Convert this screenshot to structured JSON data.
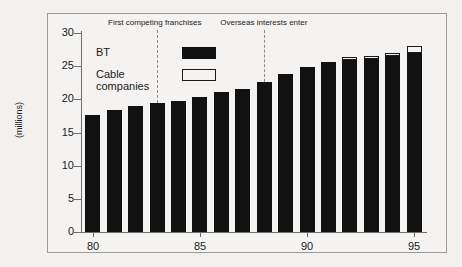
{
  "chart_data": {
    "type": "bar",
    "title": "",
    "subtitle": "",
    "xlabel": "",
    "ylabel": "(millions)",
    "ylim": [
      0,
      30
    ],
    "yticks": [
      0,
      5,
      10,
      15,
      20,
      25,
      30
    ],
    "ytick_labels": [
      "0",
      "5",
      "10",
      "15",
      "20",
      "25",
      "30"
    ],
    "xticks": [
      80,
      85,
      90,
      95
    ],
    "xtick_labels": [
      "80",
      "85",
      "90",
      "95"
    ],
    "categories": [
      "80",
      "81",
      "82",
      "83",
      "84",
      "85",
      "86",
      "87",
      "88",
      "89",
      "90",
      "91",
      "92",
      "93",
      "94",
      "95"
    ],
    "grid": false,
    "legend_position": "inside-top-left",
    "stacked": true,
    "series": [
      {
        "name": "BT",
        "color": "#111111",
        "values": [
          17.6,
          18.4,
          19.0,
          19.4,
          19.7,
          20.4,
          21.1,
          21.6,
          22.6,
          23.8,
          24.9,
          25.6,
          25.9,
          26.1,
          26.6,
          27.0
        ]
      },
      {
        "name": "Cable companies",
        "color": "#ffffff",
        "values": [
          0,
          0,
          0,
          0,
          0,
          0,
          0,
          0,
          0,
          0,
          0,
          0,
          0.2,
          0.3,
          0.4,
          1.1
        ]
      }
    ],
    "annotations": [
      {
        "label": "First competing franchises",
        "x_category": "83",
        "line_style": "dashed"
      },
      {
        "label": "Overseas interests enter",
        "x_category": "88",
        "line_style": "dashed"
      }
    ]
  },
  "legend": {
    "items": [
      {
        "label": "BT",
        "swatch": "filled"
      },
      {
        "label": "Cable",
        "label2": "companies",
        "swatch": "outline"
      }
    ]
  },
  "colors": {
    "bt_bar": "#111111",
    "cable_bar": "#ffffff",
    "axis": "#6e6e6a",
    "background": "#f2f1ef",
    "panel": "#f4f3f1",
    "text": "#1b1b1b",
    "annotation_line": "#8a8a86"
  }
}
